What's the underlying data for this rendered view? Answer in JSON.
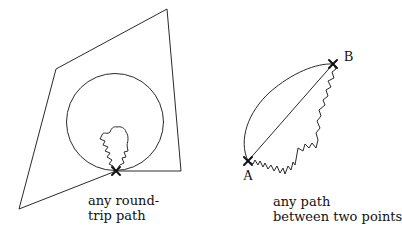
{
  "left_figure": {
    "caption_line1": "any round-",
    "caption_line2": "trip path",
    "quadrilateral": [
      [
        167,
        9
      ],
      [
        56,
        69
      ],
      [
        19,
        209
      ],
      [
        116,
        171
      ],
      [
        181,
        171
      ]
    ],
    "circle": {
      "cx": 115,
      "cy": 122,
      "r": 48
    },
    "start_point": [
      116,
      171
    ]
  },
  "right_figure": {
    "caption_line1": "any path",
    "caption_line2": "between two points",
    "point_a": {
      "label": "A",
      "x": 248,
      "y": 161
    },
    "point_b": {
      "label": "B",
      "x": 333,
      "y": 64
    }
  },
  "colors": {
    "stroke": "#2a2a2a",
    "background": "#ffffff"
  }
}
